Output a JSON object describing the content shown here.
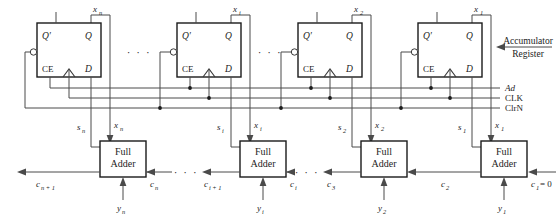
{
  "diagram": {
    "annotation": {
      "line1": "Accumulator",
      "line2": "Register"
    },
    "flipflops": [
      {
        "id": "ff-n",
        "qbar": "Q′",
        "q": "Q",
        "ce": "CE",
        "d": "D",
        "out": "x",
        "sub": "n"
      },
      {
        "id": "ff-i",
        "qbar": "Q′",
        "q": "Q",
        "ce": "CE",
        "d": "D",
        "out": "x",
        "sub": "i"
      },
      {
        "id": "ff-2",
        "qbar": "Q′",
        "q": "Q",
        "ce": "CE",
        "d": "D",
        "out": "x",
        "sub": "2"
      },
      {
        "id": "ff-1",
        "qbar": "Q′",
        "q": "Q",
        "ce": "CE",
        "d": "D",
        "out": "x",
        "sub": "1"
      }
    ],
    "adders": [
      {
        "id": "fa-n",
        "l1": "Full",
        "l2": "Adder",
        "sum": "s",
        "sum_sub": "n",
        "xin": "x",
        "xin_sub": "n",
        "y": "y",
        "y_sub": "n",
        "cout": "c",
        "cout_sub": "n + 1",
        "cin": "c",
        "cin_sub": "n"
      },
      {
        "id": "fa-i",
        "l1": "Full",
        "l2": "Adder",
        "sum": "s",
        "sum_sub": "i",
        "xin": "x",
        "xin_sub": "i",
        "y": "y",
        "y_sub": "i",
        "cout": "c",
        "cout_sub": "i + 1",
        "cin": "c",
        "cin_sub": "i"
      },
      {
        "id": "fa-2",
        "l1": "Full",
        "l2": "Adder",
        "sum": "s",
        "sum_sub": "2",
        "xin": "x",
        "xin_sub": "2",
        "y": "y",
        "y_sub": "2",
        "cout": "c",
        "cout_sub": "3",
        "cin": "c",
        "cin_sub": "2"
      },
      {
        "id": "fa-1",
        "l1": "Full",
        "l2": "Adder",
        "sum": "s",
        "sum_sub": "1",
        "xin": "x",
        "xin_sub": "1",
        "y": "y",
        "y_sub": "1",
        "cout": "c",
        "cout_sub": "2",
        "cin": "c",
        "cin_sub": "1",
        "cin_value": " = 0"
      }
    ],
    "buses": [
      {
        "id": "bus-ad",
        "label": "Ad",
        "italic": true
      },
      {
        "id": "bus-clk",
        "label": "CLK",
        "italic": false
      },
      {
        "id": "bus-clrn",
        "label": "ClrN",
        "italic": false
      }
    ],
    "ellipsis": "· · ·",
    "colors": {
      "wire": "#4a4a4a",
      "box_stroke": "#1a1a1a",
      "text": "#1c1c1c",
      "background": "#ffffff"
    }
  }
}
